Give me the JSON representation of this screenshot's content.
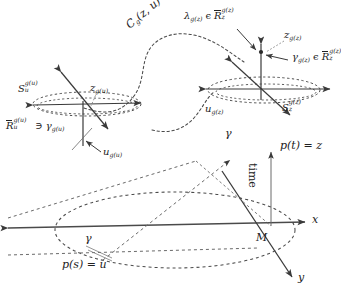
{
  "figure": {
    "background": "#ffffff",
    "stroke_color": "#3a3a3a",
    "dash_color": "#4a4a4a",
    "width": 338,
    "height": 301
  },
  "labels": {
    "curve_cg": "C",
    "curve_cg_sub": "g",
    "curve_cg_arg": "(z, u)",
    "left_S": "S",
    "left_S_sub": "u",
    "left_S_sup": "g(u)",
    "left_z": "z",
    "left_z_sub": "g(u)",
    "left_Rbar": "R",
    "left_Rbar_sub": "u",
    "left_Rbar_sup": "g(u)",
    "left_ni": "∋",
    "left_gamma": "γ",
    "left_gamma_sub": "g(u)",
    "left_u": "u",
    "left_u_sub": "g(u)",
    "right_lambda": "λ",
    "right_lambda_sub": "g(z)",
    "right_in": "ϵ",
    "right_lambda_R": "R",
    "right_lambda_R_sub": "z",
    "right_lambda_R_sup": "g(z)",
    "right_z": "z",
    "right_z_sub": "g(z)",
    "right_gamma": "γ",
    "right_gamma_sub": "g(z)",
    "right_gamma_in": "ϵ",
    "right_gamma_R": "R",
    "right_gamma_R_sub": "z",
    "right_gamma_R_sup": "g(z)",
    "right_u": "u",
    "right_u_sub": "g(z)",
    "right_S": "S",
    "right_S_sub": "z",
    "right_S_sup": "g(z)",
    "cone_gamma_top": "γ",
    "cone_pt": "p(t) = z",
    "cone_time": "time",
    "cone_M": "M",
    "axis_x": "x",
    "axis_y": "y",
    "cone_gamma_bottom": "γ",
    "cone_ps": "p(s) = u"
  }
}
